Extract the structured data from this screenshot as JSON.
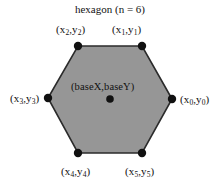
{
  "figure": {
    "title": "hexagon (n = 6)",
    "center_label": "(baseX,baseY)",
    "background_color": "#ffffff",
    "fill_color": "#969696",
    "stroke_color": "#2b2b2b",
    "vertex_dot_color": "#111111",
    "text_color": "#111111"
  },
  "vertices": [
    {
      "id": "v0",
      "label_prefix": "(x",
      "label_sub1": "0",
      "label_mid": ",y",
      "label_sub2": "0",
      "label_suffix": ")",
      "x": 172,
      "y": 99
    },
    {
      "id": "v1",
      "label_prefix": "(x",
      "label_sub1": "1",
      "label_mid": ",y",
      "label_sub2": "1",
      "label_suffix": ")",
      "x": 142,
      "y": 46
    },
    {
      "id": "v2",
      "label_prefix": "(x",
      "label_sub1": "2",
      "label_mid": ",y",
      "label_sub2": "2",
      "label_suffix": ")",
      "x": 78,
      "y": 46
    },
    {
      "id": "v3",
      "label_prefix": "(x",
      "label_sub1": "3",
      "label_mid": ",y",
      "label_sub2": "3",
      "label_suffix": ")",
      "x": 48,
      "y": 98
    },
    {
      "id": "v4",
      "label_prefix": "(x",
      "label_sub1": "4",
      "label_mid": ",y",
      "label_sub2": "4",
      "label_suffix": ")",
      "x": 78,
      "y": 153
    },
    {
      "id": "v5",
      "label_prefix": "(x",
      "label_sub1": "5",
      "label_mid": ",y",
      "label_sub2": "5",
      "label_suffix": ")",
      "x": 142,
      "y": 153
    }
  ],
  "center_point": {
    "x": 110,
    "y": 99
  }
}
